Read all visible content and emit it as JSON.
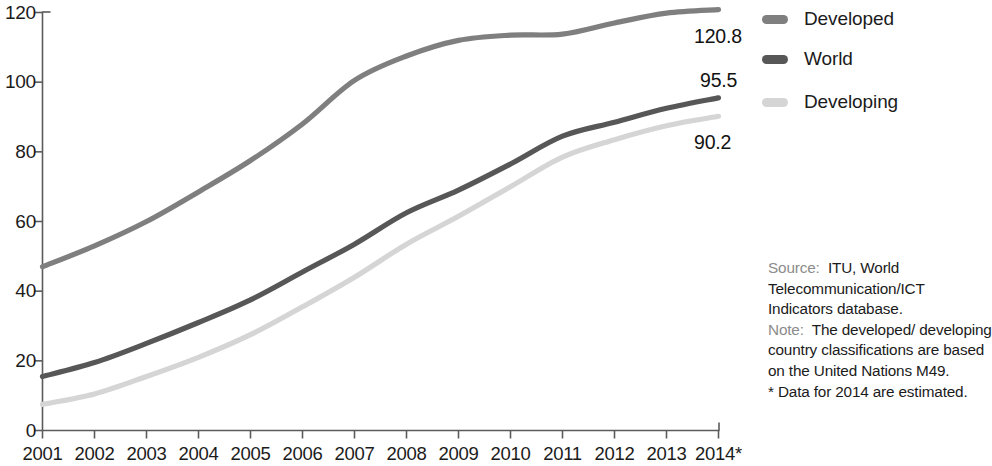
{
  "chart_data": {
    "type": "line",
    "title": "",
    "subtitle": "",
    "xlabel": "",
    "ylabel": "",
    "xlim": [
      2001,
      2014
    ],
    "ylim": [
      0,
      120
    ],
    "y_ticks": [
      0,
      20,
      40,
      60,
      80,
      100,
      120
    ],
    "grid": false,
    "legend_position": "right-top",
    "categories": [
      "2001",
      "2002",
      "2003",
      "2004",
      "2005",
      "2006",
      "2007",
      "2008",
      "2009",
      "2010",
      "2011",
      "2012",
      "2013",
      "2014*"
    ],
    "x": [
      2001,
      2002,
      2003,
      2004,
      2005,
      2006,
      2007,
      2008,
      2009,
      2010,
      2011,
      2012,
      2013,
      2014
    ],
    "series": [
      {
        "name": "Developed",
        "color": "#7f7f7f",
        "end_label": "120.8",
        "values": [
          47.0,
          53.0,
          60.0,
          68.5,
          77.5,
          88.0,
          100.5,
          107.5,
          112.0,
          113.5,
          113.8,
          117.0,
          119.8,
          120.8
        ]
      },
      {
        "name": "World",
        "color": "#575757",
        "end_label": "95.5",
        "values": [
          15.5,
          19.5,
          25.0,
          31.0,
          37.5,
          45.5,
          53.5,
          62.5,
          69.0,
          76.5,
          84.5,
          88.5,
          92.5,
          95.5
        ]
      },
      {
        "name": "Developing",
        "color": "#d5d5d5",
        "end_label": "90.2",
        "values": [
          7.5,
          10.5,
          15.5,
          21.0,
          27.5,
          35.5,
          44.0,
          53.5,
          61.5,
          70.0,
          78.5,
          83.5,
          87.5,
          90.2
        ]
      }
    ]
  },
  "legend": {
    "items": [
      {
        "label": "Developed",
        "color": "#7f7f7f"
      },
      {
        "label": "World",
        "color": "#575757"
      },
      {
        "label": "Developing",
        "color": "#d5d5d5"
      }
    ]
  },
  "value_labels": {
    "developed": "120.8",
    "world": "95.5",
    "developing": "90.2"
  },
  "axis": {
    "y_ticks": [
      "0",
      "20",
      "40",
      "60",
      "80",
      "100",
      "120"
    ],
    "x_ticks": [
      "2001",
      "2002",
      "2003",
      "2004",
      "2005",
      "2006",
      "2007",
      "2008",
      "2009",
      "2010",
      "2011",
      "2012",
      "2013",
      "2014*"
    ]
  },
  "source_note": {
    "source_kicker": "Source:",
    "source_text": "ITU, World Telecommunication/ICT Indicators database.",
    "note_kicker": "Note:",
    "note_text": "The developed/ developing country classifications are based on the United Nations M49.",
    "footnote": "* Data for 2014 are estimated."
  },
  "colors": {
    "developed": "#7f7f7f",
    "world": "#575757",
    "developing": "#d5d5d5",
    "axis": "#5b5b5b",
    "text": "#1b1b1b",
    "kicker": "#8c8c8c"
  }
}
